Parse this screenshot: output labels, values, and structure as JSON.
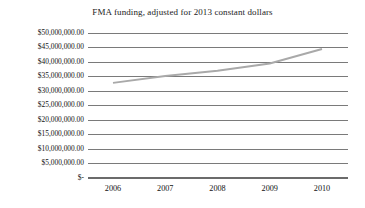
{
  "chart_data": {
    "type": "line",
    "title": "FMA funding, adjusted for 2013 constant dollars",
    "xlabel": "",
    "ylabel": "",
    "categories": [
      "2006",
      "2007",
      "2008",
      "2009",
      "2010"
    ],
    "x": [
      2006,
      2007,
      2008,
      2009,
      2010
    ],
    "values": [
      32800000,
      35200000,
      37000000,
      39500000,
      44500000
    ],
    "series": [
      {
        "name": "FMA funding",
        "values": [
          32800000,
          35200000,
          37000000,
          39500000,
          44500000
        ]
      }
    ],
    "ylim": [
      0,
      50000000
    ],
    "y_ticks": [
      0,
      5000000,
      10000000,
      15000000,
      20000000,
      25000000,
      30000000,
      35000000,
      40000000,
      45000000,
      50000000
    ],
    "y_tick_labels": [
      "$-",
      "$5,000,000.00",
      "$10,000,000.00",
      "$15,000,000.00",
      "$20,000,000.00",
      "$25,000,000.00",
      "$30,000,000.00",
      "$35,000,000.00",
      "$40,000,000.00",
      "$45,000,000.00",
      "$50,000,000.00"
    ],
    "x_tick_labels": [
      "2006",
      "2007",
      "2008",
      "2009",
      "2010"
    ],
    "grid": true,
    "grid_axis": "y",
    "legend": false,
    "legend_position": "none",
    "colors": {
      "line": "#a9a9a9",
      "grid": "#6b6b6b",
      "text": "#111111",
      "background": "#ffffff"
    }
  }
}
